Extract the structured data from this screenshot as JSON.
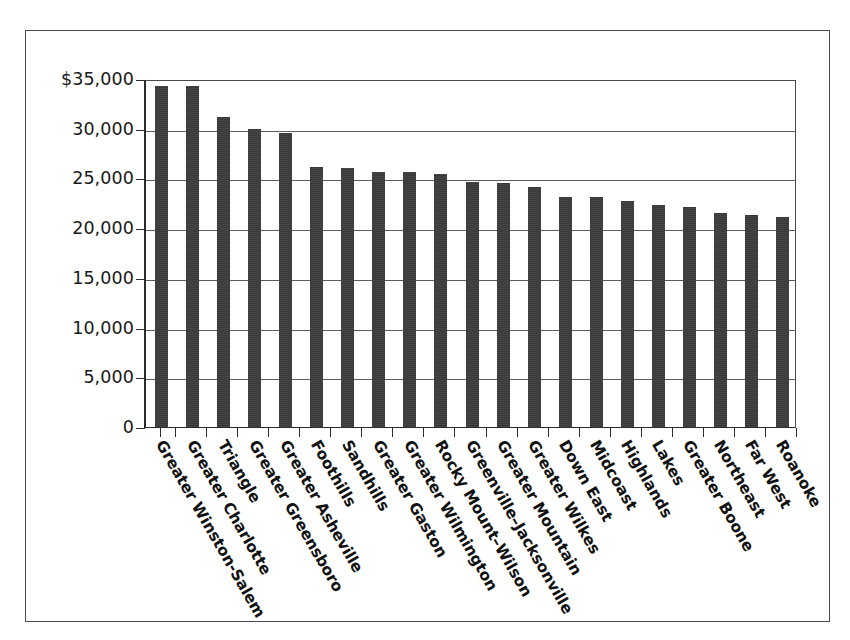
{
  "chart_data": {
    "type": "bar",
    "title": "",
    "subtitle": "",
    "xlabel": "",
    "ylabel": "",
    "legend": [],
    "grid": true,
    "ylim": [
      0,
      35000
    ],
    "ytick_labels": [
      "$35,000",
      "30,000",
      "25,000",
      "20,000",
      "15,000",
      "10,000",
      "5,000",
      "0"
    ],
    "ytick_values": [
      35000,
      30000,
      25000,
      20000,
      15000,
      10000,
      5000,
      0
    ],
    "categories": [
      "Greater Winston-Salem",
      "Greater Charlotte",
      "Triangle",
      "Greater Greensboro",
      "Greater Asheville",
      "Foothills",
      "Sandhills",
      "Greater Gaston",
      "Greater Wilmington",
      "Rocky Mount–Wilson",
      "Greenville–Jacksonville",
      "Greater Mountain",
      "Greater Wilkes",
      "Down East",
      "Midcoast",
      "Highlands",
      "Lakes",
      "Greater Boone",
      "Northeast",
      "Far West",
      "Roanoke"
    ],
    "values": [
      34300,
      34250,
      31200,
      30000,
      29600,
      26200,
      26050,
      25650,
      25650,
      25400,
      24650,
      24550,
      24100,
      23150,
      23100,
      22700,
      22350,
      22100,
      21500,
      21300,
      21100
    ]
  }
}
